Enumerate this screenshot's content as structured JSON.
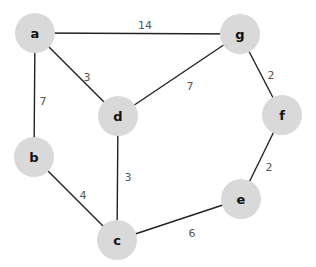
{
  "graph": {
    "nodes": [
      {
        "id": "a",
        "label": "a",
        "x": 35,
        "y": 33
      },
      {
        "id": "g",
        "label": "g",
        "x": 240,
        "y": 34
      },
      {
        "id": "d",
        "label": "d",
        "x": 118,
        "y": 116
      },
      {
        "id": "f",
        "label": "f",
        "x": 282,
        "y": 115
      },
      {
        "id": "b",
        "label": "b",
        "x": 34,
        "y": 157
      },
      {
        "id": "e",
        "label": "e",
        "x": 241,
        "y": 199
      },
      {
        "id": "c",
        "label": "c",
        "x": 117,
        "y": 240
      }
    ],
    "edges": [
      {
        "from": "a",
        "to": "g",
        "weight": "14",
        "lx": 145,
        "ly": 26
      },
      {
        "from": "a",
        "to": "d",
        "weight": "3",
        "lx": 87,
        "ly": 78
      },
      {
        "from": "a",
        "to": "b",
        "weight": "7",
        "lx": 43,
        "ly": 102
      },
      {
        "from": "g",
        "to": "d",
        "weight": "7",
        "lx": 190,
        "ly": 87
      },
      {
        "from": "g",
        "to": "f",
        "weight": "2",
        "lx": 271,
        "ly": 76
      },
      {
        "from": "d",
        "to": "c",
        "weight": "3",
        "lx": 128,
        "ly": 178
      },
      {
        "from": "b",
        "to": "c",
        "weight": "4",
        "lx": 83,
        "ly": 196
      },
      {
        "from": "f",
        "to": "e",
        "weight": "2",
        "lx": 269,
        "ly": 168
      },
      {
        "from": "c",
        "to": "e",
        "weight": "6",
        "lx": 192,
        "ly": 234
      }
    ],
    "node_radius": 20,
    "node_fill": "#d9d9d9",
    "edge_color": "#222222"
  }
}
